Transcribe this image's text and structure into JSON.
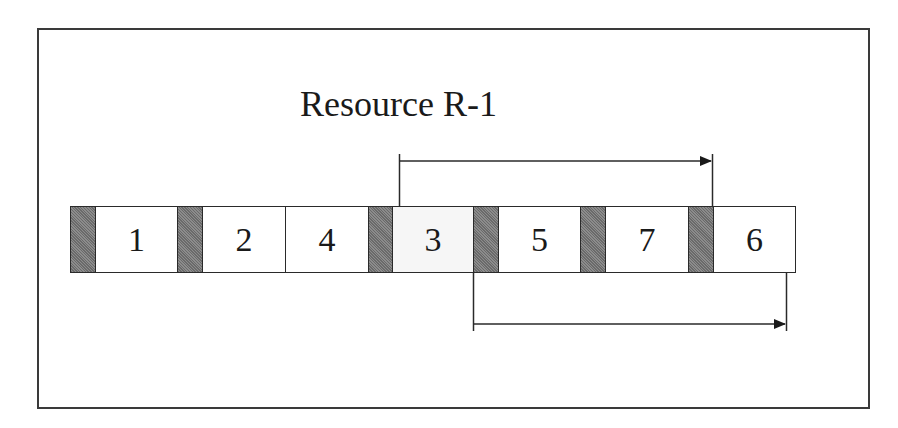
{
  "diagram": {
    "title": "Resource R-1",
    "sequence": [
      {
        "type": "setup",
        "label": ""
      },
      {
        "type": "job",
        "label": "1"
      },
      {
        "type": "setup",
        "label": ""
      },
      {
        "type": "job",
        "label": "2"
      },
      {
        "type": "job",
        "label": "4"
      },
      {
        "type": "setup",
        "label": ""
      },
      {
        "type": "job",
        "label": "3"
      },
      {
        "type": "setup",
        "label": ""
      },
      {
        "type": "job",
        "label": "5"
      },
      {
        "type": "setup",
        "label": ""
      },
      {
        "type": "job",
        "label": "7"
      },
      {
        "type": "setup",
        "label": ""
      },
      {
        "type": "job",
        "label": "6"
      }
    ],
    "arrows": [
      {
        "position": "above",
        "from_job": "3",
        "to_job": "6",
        "direction": "right"
      },
      {
        "position": "below",
        "from_job": "5",
        "to_job": "6",
        "direction": "right"
      }
    ],
    "colors": {
      "setup_fill": "#7a7a7a",
      "job_fill": "#ffffff",
      "job3_fill": "#f6f6f6",
      "line": "#2a2a2a"
    }
  }
}
